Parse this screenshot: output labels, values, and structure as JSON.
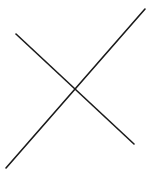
{
  "figure": {
    "stroke_color": "#1a1a1a",
    "background_color": "#ffffff",
    "stroke_width": 1.6,
    "lines": [
      {
        "name": "ascending-stroke",
        "x1": 6,
        "y1": 168,
        "x2": 145,
        "y2": 9
      },
      {
        "name": "descending-stroke",
        "x1": 16,
        "y1": 34,
        "x2": 134,
        "y2": 144
      }
    ]
  }
}
